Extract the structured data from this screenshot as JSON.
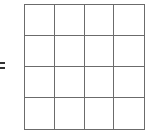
{
  "diagram": {
    "symbol": "=",
    "grid": {
      "rows": 4,
      "cols": 4,
      "cells_filled": []
    },
    "line_color": "#6b6b6b"
  }
}
